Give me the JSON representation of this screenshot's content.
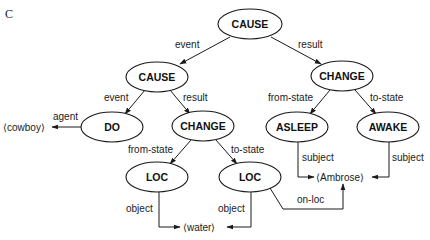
{
  "panel_label": "C",
  "nodes": {
    "cause_top": "CAUSE",
    "cause_mid": "CAUSE",
    "change_right": "CHANGE",
    "do": "DO",
    "change_mid": "CHANGE",
    "asleep": "ASLEEP",
    "awake": "AWAKE",
    "loc_left": "LOC",
    "loc_right": "LOC"
  },
  "entities": {
    "cowboy": "⟨cowboy⟩",
    "water": "⟨water⟩",
    "ambrose": "⟨Ambrose⟩"
  },
  "edge_labels": {
    "top_event": "event",
    "top_result": "result",
    "mid_event": "event",
    "mid_result": "result",
    "right_from_state": "from-state",
    "right_to_state": "to-state",
    "agent": "agent",
    "mid_from_state": "from-state",
    "mid_to_state": "to-state",
    "asleep_subject": "subject",
    "awake_subject": "subject",
    "loc_left_object": "object",
    "loc_right_object": "object",
    "on_loc": "on-loc"
  },
  "colors": {
    "stroke": "#1a1a1a",
    "background": "#ffffff"
  }
}
